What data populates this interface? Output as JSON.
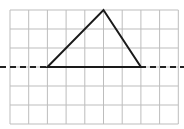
{
  "diagram": {
    "type": "grid-geometry",
    "grid": {
      "columns": 9,
      "rows": 6,
      "left": 10,
      "top": 10,
      "cell_width": 18.7,
      "cell_height": 19,
      "line_color": "#bdbdbd"
    },
    "dashed_line": {
      "row_index": 3,
      "color": "#222222",
      "extends_from_x": 0,
      "extends_to_x": 184
    },
    "triangle": {
      "vertices_grid": [
        [
          2,
          3
        ],
        [
          7,
          3
        ],
        [
          5,
          0
        ]
      ],
      "stroke_color": "#1a1a1a"
    }
  }
}
